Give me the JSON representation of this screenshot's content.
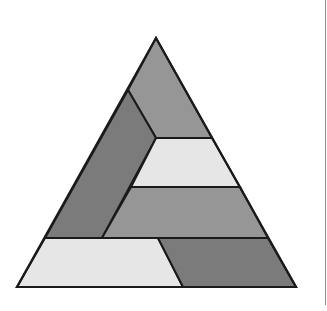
{
  "diagram": {
    "outline": {
      "apex": [
        156,
        38
      ],
      "bottom_left": [
        17,
        287
      ],
      "bottom_right": [
        296,
        287
      ],
      "stroke": "#1a1a1a"
    },
    "colors": {
      "dark": "#7b7b7b",
      "medium": "#969696",
      "light": "#e6e6e6",
      "stroke": "#1a1a1a",
      "rule": "#8a8a8a"
    },
    "pieces": [
      {
        "name": "top-piece",
        "shade": "medium",
        "points": "156,38 212,138 156,138 128,90"
      },
      {
        "name": "left-parallelogram",
        "shade": "dark",
        "points": "128,90 156,138 102,238 45,238"
      },
      {
        "name": "upper-band",
        "shade": "light",
        "points": "156,138 212,138 240,187 131,187"
      },
      {
        "name": "middle-band",
        "shade": "medium",
        "points": "131,187 240,187 268,238 102,238"
      },
      {
        "name": "bottom-left-piece",
        "shade": "light",
        "points": "45,238 158,238 183,287 17,287"
      },
      {
        "name": "bottom-right-piece",
        "shade": "dark",
        "points": "158,238 268,238 296,287 183,287"
      }
    ]
  }
}
